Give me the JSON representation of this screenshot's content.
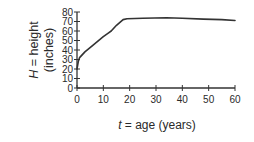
{
  "chart_data": {
    "type": "line",
    "title": "",
    "xlabel": "t = age (years)",
    "xlabel_var": "t",
    "xlabel_rest": " = age (years)",
    "ylabel_line1_var": "H",
    "ylabel_line1_rest": " = height",
    "ylabel_line2": "(inches)",
    "xlim": [
      0,
      60
    ],
    "ylim": [
      0,
      80
    ],
    "xticks": [
      0,
      10,
      20,
      30,
      40,
      50,
      60
    ],
    "yticks": [
      0,
      10,
      20,
      30,
      40,
      50,
      60,
      70,
      80
    ],
    "xtick_labels": [
      "0",
      "10",
      "20",
      "30",
      "40",
      "50",
      "60"
    ],
    "ytick_labels": [
      "0",
      "10",
      "20",
      "30",
      "40",
      "50",
      "60",
      "70",
      "80"
    ],
    "grid": false,
    "legend": null,
    "series": [
      {
        "name": "height",
        "color": "#333333",
        "x": [
          0,
          0.5,
          1,
          3,
          6,
          10,
          12,
          13,
          15,
          17.5,
          19,
          25,
          34,
          40,
          48,
          55,
          60
        ],
        "y": [
          20,
          28,
          32,
          38,
          45,
          54,
          58,
          60,
          66,
          72,
          73,
          73.5,
          74,
          73.5,
          72.5,
          72,
          71
        ]
      }
    ]
  }
}
